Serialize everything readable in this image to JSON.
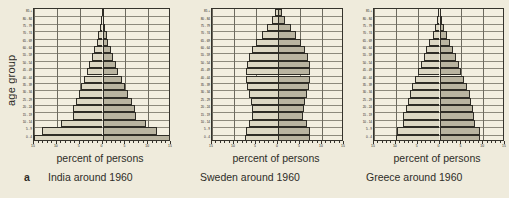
{
  "figure": {
    "letter": "a",
    "y_axis_label": "age group",
    "x_axis_title": "percent of persons"
  },
  "panels": [
    {
      "caption": "India around 1960"
    },
    {
      "caption": "Sweden around 1960"
    },
    {
      "caption": "Greece around 1960"
    }
  ],
  "chart_data": [
    {
      "type": "bar",
      "subtype": "population-pyramid",
      "title": "India around 1960",
      "xlabel": "percent of persons",
      "ylabel": "age group",
      "xlim": [
        -15,
        15
      ],
      "xtick_labels": [
        "15",
        "10",
        "5",
        "0",
        "5",
        "10",
        "15"
      ],
      "xticks": [
        -15,
        -10,
        -5,
        0,
        5,
        10,
        15
      ],
      "minor_tick_step": 1,
      "grid": true,
      "legend": null,
      "categories": [
        "0 - 4",
        "5 - 9",
        "10 - 14",
        "15 - 19",
        "20 - 24",
        "25 - 29",
        "30 - 34",
        "35 - 39",
        "40 - 44",
        "45 - 49",
        "50 - 54",
        "55 - 59",
        "60 - 64",
        "65 - 69",
        "70 - 74",
        "75 - 79",
        "80 - 84",
        "85 +"
      ],
      "series": [
        {
          "name": "male",
          "side": "left",
          "values": [
            15.0,
            13.2,
            9.0,
            6.5,
            6.4,
            5.8,
            5.2,
            4.6,
            4.0,
            3.4,
            2.9,
            2.3,
            1.9,
            1.3,
            0.9,
            0.5,
            0.3,
            0.2
          ]
        },
        {
          "name": "female",
          "side": "right",
          "values": [
            15.0,
            12.0,
            9.6,
            7.4,
            7.2,
            6.4,
            5.5,
            4.9,
            4.2,
            3.5,
            2.9,
            2.4,
            1.8,
            1.3,
            0.9,
            0.5,
            0.3,
            0.2
          ]
        }
      ]
    },
    {
      "type": "bar",
      "subtype": "population-pyramid",
      "title": "Sweden around 1960",
      "xlabel": "percent of persons",
      "ylabel": "age group",
      "xlim": [
        -15,
        15
      ],
      "xtick_labels": [
        "15",
        "10",
        "5",
        "0",
        "5",
        "10",
        "15"
      ],
      "xticks": [
        -15,
        -10,
        -5,
        0,
        5,
        10,
        15
      ],
      "minor_tick_step": 1,
      "grid": true,
      "legend": null,
      "categories": [
        "0 - 4",
        "5 - 9",
        "10 - 14",
        "15 - 19",
        "20 - 24",
        "25 - 29",
        "30 - 34",
        "35 - 39",
        "40 - 44",
        "45 - 49",
        "50 - 54",
        "55 - 59",
        "60 - 64",
        "65 - 69",
        "70 - 74",
        "75 - 79",
        "80 - 84",
        "85 +"
      ],
      "series": [
        {
          "name": "male",
          "side": "left",
          "values": [
            7.4,
            7.3,
            6.6,
            5.8,
            5.8,
            6.2,
            6.6,
            7.0,
            7.2,
            7.2,
            7.1,
            6.7,
            5.9,
            4.9,
            3.7,
            2.5,
            1.4,
            0.7
          ]
        },
        {
          "name": "female",
          "side": "right",
          "values": [
            7.3,
            7.2,
            6.5,
            5.7,
            5.8,
            6.2,
            6.6,
            7.0,
            7.2,
            7.3,
            7.2,
            6.9,
            6.2,
            5.2,
            4.1,
            2.9,
            1.7,
            0.9
          ]
        }
      ]
    },
    {
      "type": "bar",
      "subtype": "population-pyramid",
      "title": "Greece around 1960",
      "xlabel": "percent of persons",
      "ylabel": "age group",
      "xlim": [
        -15,
        15
      ],
      "xtick_labels": [
        "15",
        "10",
        "5",
        "0",
        "5",
        "10",
        "15"
      ],
      "xticks": [
        -15,
        -10,
        -5,
        0,
        5,
        10,
        15
      ],
      "minor_tick_step": 1,
      "grid": true,
      "legend": null,
      "categories": [
        "0 - 4",
        "5 - 9",
        "10 - 14",
        "15 - 19",
        "20 - 24",
        "25 - 29",
        "30 - 34",
        "35 - 39",
        "40 - 44",
        "45 - 49",
        "50 - 54",
        "55 - 59",
        "60 - 64",
        "65 - 69",
        "70 - 74",
        "75 - 79",
        "80 - 84",
        "85 +"
      ],
      "series": [
        {
          "name": "male",
          "side": "left",
          "values": [
            9.9,
            9.8,
            8.4,
            8.3,
            7.6,
            7.2,
            6.8,
            6.2,
            5.6,
            4.9,
            4.3,
            3.6,
            3.0,
            2.3,
            1.6,
            1.0,
            0.5,
            0.3
          ]
        },
        {
          "name": "female",
          "side": "right",
          "values": [
            9.2,
            9.2,
            8.1,
            8.0,
            7.6,
            7.3,
            6.9,
            6.3,
            5.7,
            5.0,
            4.4,
            3.7,
            3.1,
            2.4,
            1.7,
            1.1,
            0.6,
            0.3
          ]
        }
      ]
    }
  ]
}
